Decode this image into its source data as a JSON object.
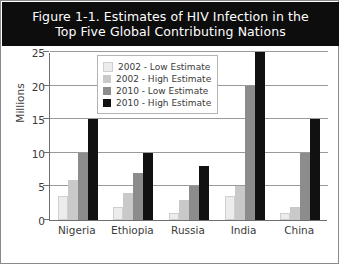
{
  "figure": {
    "title": "Figure 1-1. Estimates of HIV Infection in the\nTop Five Global Contributing Nations"
  },
  "chart_data": {
    "type": "bar",
    "title": "Figure 1-1. Estimates of HIV Infection in the Top Five Global Contributing Nations",
    "xlabel": "",
    "ylabel": "Millions",
    "ylim": [
      0,
      25
    ],
    "yticks": [
      0,
      5,
      10,
      15,
      20,
      25
    ],
    "ytick_labels": [
      "0",
      "5",
      "10",
      "15",
      "20",
      "25"
    ],
    "grid": true,
    "legend_position": "upper left",
    "categories": [
      "Nigeria",
      "Ethiopia",
      "Russia",
      "India",
      "China"
    ],
    "series": [
      {
        "name": "2002 - Low Estimate",
        "color": "#ececec",
        "values": [
          3.5,
          2.0,
          1.0,
          3.5,
          1.0
        ]
      },
      {
        "name": "2002 - High Estimate",
        "color": "#c9c9c9",
        "values": [
          6.0,
          4.0,
          3.0,
          5.0,
          2.0
        ]
      },
      {
        "name": "2010 - Low Estimate",
        "color": "#8c8c8c",
        "values": [
          10.0,
          7.0,
          5.0,
          20.0,
          10.0
        ]
      },
      {
        "name": "2010 - High Estimate",
        "color": "#111111",
        "values": [
          15.0,
          10.0,
          8.0,
          25.0,
          15.0
        ]
      }
    ]
  }
}
